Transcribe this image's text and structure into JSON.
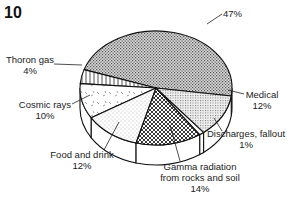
{
  "figure_number": "10",
  "chart_data": {
    "type": "pie",
    "style": "3d-exploded-none",
    "title": "",
    "start_angle_description": "largest slice occupies back half",
    "slices": [
      {
        "name": "",
        "label_lines": [
          "47%"
        ],
        "value": 47,
        "pattern": "fine-dots"
      },
      {
        "name": "Thoron gas",
        "label_lines": [
          "Thoron gas",
          "4%"
        ],
        "value": 4,
        "pattern": "vertical-lines"
      },
      {
        "name": "Cosmic rays",
        "label_lines": [
          "Cosmic rays",
          "10%"
        ],
        "value": 10,
        "pattern": "dashes"
      },
      {
        "name": "Food and drink",
        "label_lines": [
          "Food and drink",
          "12%"
        ],
        "value": 12,
        "pattern": "sparse-dots"
      },
      {
        "name": "Gamma radiation from rocks and soil",
        "label_lines": [
          "Gamma radiation",
          "from rocks and soil",
          "14%"
        ],
        "value": 14,
        "pattern": "crosshatch"
      },
      {
        "name": "Discharges, fallout",
        "label_lines": [
          "Discharges, fallout",
          "1%"
        ],
        "value": 1,
        "pattern": "white"
      },
      {
        "name": "Medical",
        "label_lines": [
          "Medical",
          "12%"
        ],
        "value": 12,
        "pattern": "grid-dots"
      }
    ],
    "units": "%"
  }
}
